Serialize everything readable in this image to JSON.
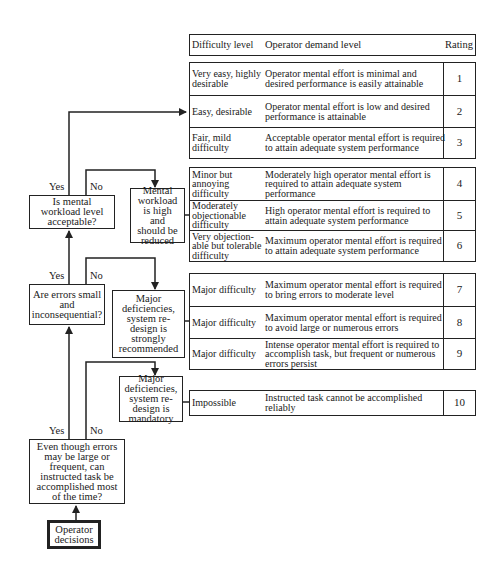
{
  "colors": {
    "line": "#222222",
    "background": "#ffffff",
    "text": "#1a1a1a"
  },
  "table": {
    "header": {
      "difficulty": "Difficulty level",
      "demand": "Operator demand level",
      "rating": "Rating"
    },
    "groups": [
      {
        "rows": [
          {
            "difficulty": "Very easy, highly desirable",
            "demand": "Operator mental effort is minimal and desired performance is easily attainable",
            "rating": "1"
          },
          {
            "difficulty": "Easy, desirable",
            "demand": "Operator mental effort is low and desired performance is attainable",
            "rating": "2"
          },
          {
            "difficulty": "Fair, mild difficulty",
            "demand": "Acceptable operator mental effort is required to attain adequate system performance",
            "rating": "3"
          }
        ]
      },
      {
        "rows": [
          {
            "difficulty": "Minor but annoying difficulty",
            "demand": "Moderately high operator mental effort is required to attain adequate system performance",
            "rating": "4"
          },
          {
            "difficulty": "Moderately objectionable difficulty",
            "demand": "High operator mental effort is required to attain adequate system performance",
            "rating": "5"
          },
          {
            "difficulty": "Very objection-able but tolerable difficulty",
            "demand": "Maximum operator mental effort is required to attain adequate system performance",
            "rating": "6"
          }
        ]
      },
      {
        "rows": [
          {
            "difficulty": "Major difficulty",
            "demand": "Maximum operator mental effort is required to bring errors to moderate level",
            "rating": "7"
          },
          {
            "difficulty": "Major difficulty",
            "demand": "Maximum operator mental effort is required to avoid large or numerous errors",
            "rating": "8"
          },
          {
            "difficulty": "Major difficulty",
            "demand": "Intense operator mental effort is required to accomplish task, but frequent or numerous errors persist",
            "rating": "9"
          }
        ]
      },
      {
        "rows": [
          {
            "difficulty": "Impossible",
            "demand": "Instructed task cannot be accomplished reliably",
            "rating": "10"
          }
        ]
      }
    ]
  },
  "flow": {
    "start": "Operator decisions",
    "decisions": {
      "accomplish": "Even though errors may be large or frequent, can instructed task be accomplished most of the time?",
      "errors": "Are errors small and inconsequential?",
      "workload": "Is mental workload level acceptable?"
    },
    "outcomes": {
      "mandatory": "Major deficiencies, system re-design is mandatory",
      "recommended": "Major deficiencies, system re-design is strongly recommended",
      "reduce": "Mental workload is high and should be reduced"
    },
    "branch_labels": {
      "yes": "Yes",
      "no": "No"
    }
  }
}
